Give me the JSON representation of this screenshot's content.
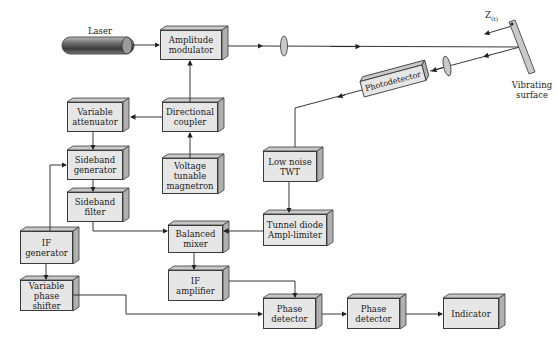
{
  "diagram": {
    "labels": {
      "laser": "Laser",
      "displacement": "Z",
      "displacement_sub": "(t)",
      "vibrating_surface_1": "Vibrating",
      "vibrating_surface_2": "surface",
      "photodetector": "Photodetector"
    },
    "blocks": {
      "amplitude_modulator": [
        "Amplitude",
        "modulator"
      ],
      "directional_coupler": [
        "Directional",
        "coupler"
      ],
      "variable_attenuator": [
        "Variable",
        "attenuator"
      ],
      "voltage_tunable_magnetron": [
        "Voltage",
        "tunable",
        "magnetron"
      ],
      "sideband_generator": [
        "Sideband",
        "generator"
      ],
      "sideband_filter": [
        "Sideband",
        "filter"
      ],
      "low_noise_twt": [
        "Low noise",
        "TWT"
      ],
      "tunnel_diode_ampl_limiter": [
        "Tunnel diode",
        "Ampl-limiter"
      ],
      "balanced_mixer": [
        "Balanced",
        "mixer"
      ],
      "if_generator": [
        "IF",
        "generator"
      ],
      "if_amplifier": [
        "IF",
        "amplifier"
      ],
      "variable_phase_shifter": [
        "Variable",
        "phase shifter"
      ],
      "phase_detector_1": [
        "Phase",
        "detector"
      ],
      "phase_detector_2": [
        "Phase",
        "detector"
      ],
      "indicator": [
        "Indicator"
      ]
    },
    "connections": [
      [
        "laser",
        "amplitude_modulator"
      ],
      [
        "amplitude_modulator",
        "lens",
        "vibrating_surface"
      ],
      [
        "vibrating_surface",
        "lens",
        "photodetector"
      ],
      [
        "photodetector",
        "low_noise_twt"
      ],
      [
        "low_noise_twt",
        "tunnel_diode_ampl_limiter"
      ],
      [
        "tunnel_diode_ampl_limiter",
        "balanced_mixer"
      ],
      [
        "voltage_tunable_magnetron",
        "directional_coupler"
      ],
      [
        "directional_coupler",
        "amplitude_modulator"
      ],
      [
        "directional_coupler",
        "variable_attenuator"
      ],
      [
        "variable_attenuator",
        "sideband_generator"
      ],
      [
        "if_generator",
        "sideband_generator"
      ],
      [
        "sideband_generator",
        "sideband_filter"
      ],
      [
        "sideband_filter",
        "balanced_mixer"
      ],
      [
        "balanced_mixer",
        "if_amplifier"
      ],
      [
        "if_amplifier",
        "phase_detector_1"
      ],
      [
        "if_generator",
        "variable_phase_shifter"
      ],
      [
        "variable_phase_shifter",
        "phase_detector_1"
      ],
      [
        "phase_detector_1",
        "phase_detector_2"
      ],
      [
        "phase_detector_2",
        "indicator"
      ]
    ]
  }
}
